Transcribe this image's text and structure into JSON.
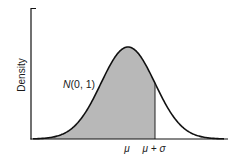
{
  "chart_data": {
    "type": "area",
    "title": "",
    "xlabel": "",
    "ylabel": "Density",
    "distribution": "normal",
    "mean": 0,
    "sd": 1,
    "curve_label": "N(0, 1)",
    "x_tick_labels": [
      "μ",
      "μ + σ"
    ],
    "x_tick_values": [
      0,
      1
    ],
    "shaded_region": {
      "from": "-inf",
      "to": 1,
      "label": "area up to μ + σ"
    },
    "xlim": [
      -3.6,
      3.7
    ],
    "ylim": [
      0,
      0.42
    ],
    "grid": false,
    "legend": null,
    "colors": {
      "curve": "#111111",
      "fill": "#b8b8b8",
      "axes": "#111111",
      "background": "#ffffff"
    }
  },
  "labels": {
    "y_axis": "Density",
    "curve": "N(0, 1)",
    "mu": "μ",
    "mu_plus_sigma": "μ + σ"
  }
}
